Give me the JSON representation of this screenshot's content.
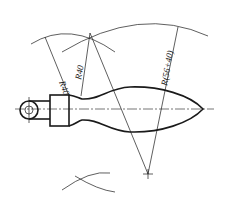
{
  "figure": {
    "dimensions": [
      {
        "id": "r1",
        "label": "R40"
      },
      {
        "id": "r2",
        "label": "R40"
      },
      {
        "id": "r3",
        "label": "R(56+40)"
      }
    ]
  },
  "colors": {
    "line": "#1a1a1a",
    "background": "#ffffff"
  }
}
